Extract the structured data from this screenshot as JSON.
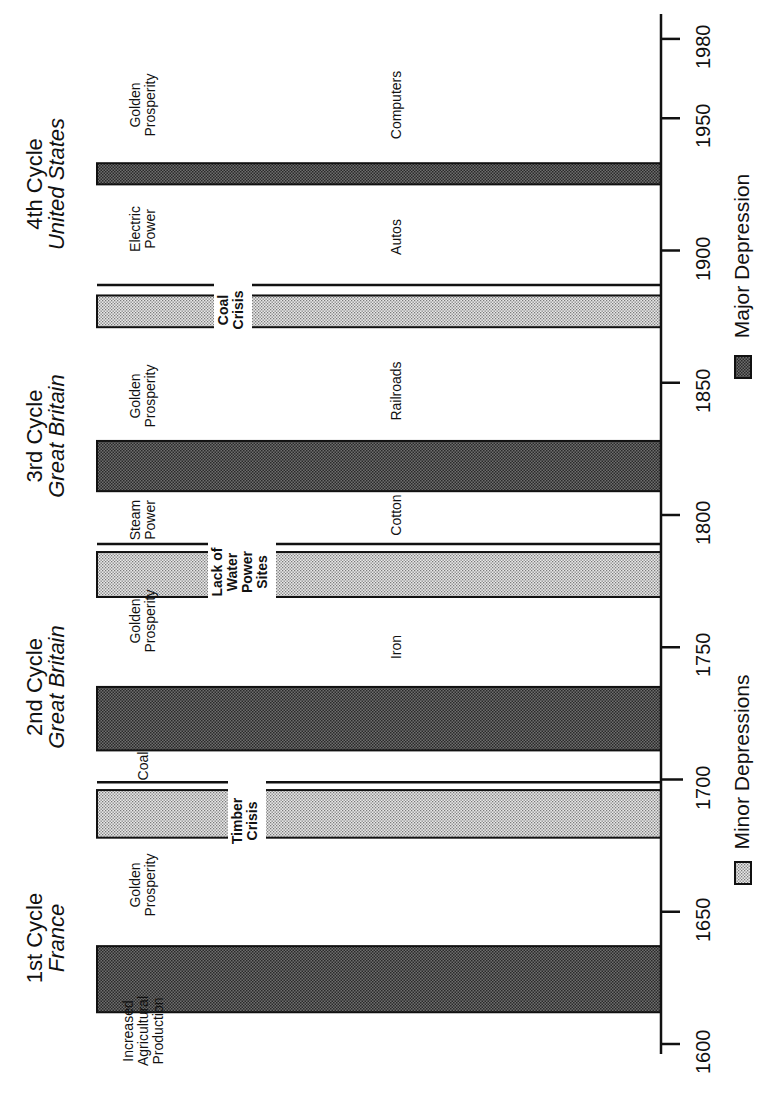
{
  "chart_data": {
    "type": "bar",
    "orientation": "rotated-90ccw (year axis vertical, bars horizontal)",
    "title": "",
    "xlabel": "",
    "ylabel": "",
    "axis": {
      "range": [
        1600,
        1985
      ],
      "ticks": [
        1600,
        1650,
        1700,
        1750,
        1800,
        1850,
        1900,
        1950,
        1980
      ],
      "tick_labels": [
        "1600",
        "1650",
        "1700",
        "1750",
        "1800",
        "1850",
        "1900",
        "1950",
        "1980"
      ]
    },
    "grid": false,
    "legend_position": "below axis (right side of rotated image)",
    "legend": [
      {
        "key": "minor",
        "label": "Minor Depressions",
        "fill": "#d0d0d0"
      },
      {
        "key": "major",
        "label": "Major Depression",
        "fill": "#707070"
      }
    ],
    "series": [
      {
        "name": "Major Depression",
        "intervals": [
          [
            1612,
            1637
          ],
          [
            1711,
            1735
          ],
          [
            1809,
            1828
          ],
          [
            1925,
            1933
          ]
        ]
      },
      {
        "name": "Minor Depressions",
        "intervals": [
          [
            1678,
            1696
          ],
          [
            1769,
            1786
          ],
          [
            1871,
            1883
          ]
        ]
      }
    ],
    "bars": [
      {
        "type": "major",
        "start": 1612,
        "end": 1637
      },
      {
        "type": "minor",
        "start": 1678,
        "end": 1696,
        "label": "Timber Crisis"
      },
      {
        "type": "major",
        "start": 1711,
        "end": 1735
      },
      {
        "type": "minor",
        "start": 1769,
        "end": 1786,
        "label": "Lack of Water Power Sites"
      },
      {
        "type": "major",
        "start": 1809,
        "end": 1828
      },
      {
        "type": "minor",
        "start": 1871,
        "end": 1883,
        "label": "Coal Crisis"
      },
      {
        "type": "major",
        "start": 1925,
        "end": 1933
      }
    ],
    "cycle_dividers": [
      1699,
      1789,
      1887
    ],
    "cycles": [
      {
        "name": "1st Cycle",
        "country": "France",
        "center": 1640
      },
      {
        "name": "2nd Cycle",
        "country": "Great Britain",
        "center": 1735
      },
      {
        "name": "3rd Cycle",
        "country": "Great Britain",
        "center": 1830
      },
      {
        "name": "4th Cycle",
        "country": "United States",
        "center": 1925
      }
    ],
    "era_labels": [
      {
        "text": [
          "Increased",
          "Agricultural",
          "Production"
        ],
        "year": 1605
      },
      {
        "text": [
          "Golden",
          "Prosperity"
        ],
        "year": 1660
      },
      {
        "text": [
          "Coal"
        ],
        "year": 1705
      },
      {
        "text": [
          "Golden",
          "Prosperity"
        ],
        "year": 1760
      },
      {
        "text": [
          "Steam",
          "Power"
        ],
        "year": 1798
      },
      {
        "text": [
          "Golden",
          "Prosperity"
        ],
        "year": 1845
      },
      {
        "text": [
          "Electric",
          "Power"
        ],
        "year": 1908
      },
      {
        "text": [
          "Golden",
          "Prosperity"
        ],
        "year": 1955
      }
    ],
    "technology_labels": [
      {
        "text": "Iron",
        "year": 1750
      },
      {
        "text": "Cotton",
        "year": 1800
      },
      {
        "text": "Railroads",
        "year": 1847
      },
      {
        "text": "Autos",
        "year": 1905
      },
      {
        "text": "Computers",
        "year": 1955
      }
    ]
  },
  "colors": {
    "major_fill": "#6e6e6e",
    "minor_fill": "#cfcfcf",
    "stroke": "#111111",
    "background": "#ffffff"
  }
}
